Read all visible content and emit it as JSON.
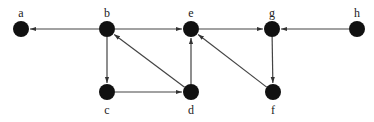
{
  "diagram": {
    "type": "directed-graph",
    "colors": {
      "node": "#111111",
      "edge": "#444444",
      "label": "#222222",
      "background": "#ffffff"
    },
    "nodes": [
      {
        "id": "a",
        "label": "a",
        "x": 21,
        "y": 29,
        "label_pos": "above"
      },
      {
        "id": "b",
        "label": "b",
        "x": 107,
        "y": 29,
        "label_pos": "above"
      },
      {
        "id": "e",
        "label": "e",
        "x": 191,
        "y": 29,
        "label_pos": "above"
      },
      {
        "id": "g",
        "label": "g",
        "x": 272,
        "y": 29,
        "label_pos": "above"
      },
      {
        "id": "h",
        "label": "h",
        "x": 357,
        "y": 29,
        "label_pos": "above"
      },
      {
        "id": "c",
        "label": "c",
        "x": 107,
        "y": 92,
        "label_pos": "below"
      },
      {
        "id": "d",
        "label": "d",
        "x": 191,
        "y": 92,
        "label_pos": "below"
      },
      {
        "id": "f",
        "label": "f",
        "x": 273,
        "y": 92,
        "label_pos": "below"
      }
    ],
    "edges": [
      {
        "from": "b",
        "to": "a"
      },
      {
        "from": "b",
        "to": "e"
      },
      {
        "from": "b",
        "to": "c"
      },
      {
        "from": "c",
        "to": "d"
      },
      {
        "from": "d",
        "to": "b"
      },
      {
        "from": "d",
        "to": "e"
      },
      {
        "from": "e",
        "to": "g"
      },
      {
        "from": "h",
        "to": "g"
      },
      {
        "from": "g",
        "to": "f"
      },
      {
        "from": "f",
        "to": "e"
      }
    ]
  }
}
